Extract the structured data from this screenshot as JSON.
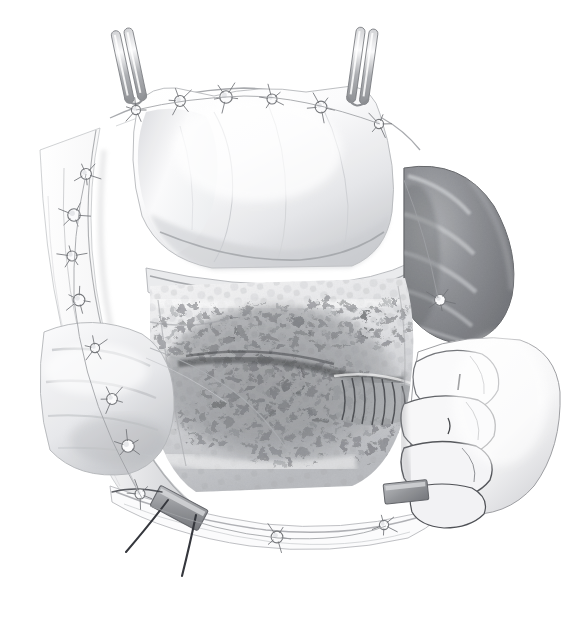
{
  "figure": {
    "domain": "medical-surgical-illustration",
    "style": "grayscale graphite / airbrush anatomical drawing on white background",
    "canvas": {
      "width": 583,
      "height": 619,
      "background": "#ffffff"
    },
    "top_crop_artifact": "· ·",
    "palette": {
      "background": "#ffffff",
      "outline": "#6f7277",
      "outline_dark": "#2f3136",
      "tissue_light": "#f3f3f4",
      "tissue_mid": "#cfd0d3",
      "tissue_shadow": "#9a9ca0",
      "spleen_dark": "#6f7176",
      "spleen_mid": "#8d9094",
      "spleen_light": "#bdbfc3",
      "tumor_dark": "#4d4f53",
      "tumor_mid": "#7e8185",
      "metal_clip": "#8a8c90",
      "suture_thread": "#2b2d33",
      "hand_outline": "#4a4c51"
    }
  },
  "structures": [
    {
      "id": "wound-edge-left",
      "label": "Left abdominal wall / wound edge",
      "region": "left margin, x 35-150, y 95-520"
    },
    {
      "id": "wound-edge-bottom",
      "label": "Inferior wound edge with sutures",
      "region": "bottom, x 110-430, y 480-560"
    },
    {
      "id": "stomach",
      "label": "Stomach (retracted cephalad)",
      "region": "upper centre, x 130-430, y 80-270"
    },
    {
      "id": "greater-omentum",
      "label": "Greater omentum / serosal fold",
      "region": "centre band, x 140-420, y 240-300"
    },
    {
      "id": "spleen",
      "label": "Spleen (lobulated, mobilised)",
      "region": "right, x 395-520, y 160-340"
    },
    {
      "id": "pancreas-bed",
      "label": "Pancreatic body / retroperitoneal bed",
      "region": "centre, x 150-400, y 290-470"
    },
    {
      "id": "nodal-mass",
      "label": "Lymph-node bearing adipose tissue",
      "region": "centre, x 160-400, y 300-470"
    },
    {
      "id": "vessel-bundle",
      "label": "Dissected vascular pedicle",
      "region": "centre-right, x 330-420, y 370-430"
    },
    {
      "id": "transverse-colon",
      "label": "Bowel loop / colon segment",
      "region": "lower left, x 45-175, y 330-470"
    },
    {
      "id": "surgeons-hand",
      "label": "Surgeon's gloved hand retracting",
      "region": "right, x 395-540, y 340-520"
    }
  ],
  "instruments": [
    {
      "id": "retractor-left",
      "name": "Double-pronged self-retaining retractor",
      "x": 133,
      "y": 75,
      "angle": -12
    },
    {
      "id": "retractor-right",
      "name": "Double-pronged self-retaining retractor",
      "x": 363,
      "y": 72,
      "angle": 8
    },
    {
      "id": "clip-center",
      "name": "Metal ligating clip / clamp jaw",
      "x": 178,
      "y": 508,
      "angle": 28
    },
    {
      "id": "clip-right",
      "name": "Metal ligating clip / clamp jaw",
      "x": 405,
      "y": 492,
      "angle": -6
    }
  ],
  "sutures": {
    "knot_count": 17,
    "knot_description": "Stay sutures with radiating cut ends along both wound margins",
    "thread_description": "Two long dark suture tails descending below the inferior wound edge",
    "knots": [
      {
        "x": 136,
        "y": 110
      },
      {
        "x": 180,
        "y": 101
      },
      {
        "x": 226,
        "y": 97
      },
      {
        "x": 272,
        "y": 99
      },
      {
        "x": 321,
        "y": 107
      },
      {
        "x": 379,
        "y": 124
      },
      {
        "x": 86,
        "y": 174
      },
      {
        "x": 74,
        "y": 215
      },
      {
        "x": 72,
        "y": 256
      },
      {
        "x": 79,
        "y": 300
      },
      {
        "x": 95,
        "y": 348
      },
      {
        "x": 112,
        "y": 399
      },
      {
        "x": 128,
        "y": 446
      },
      {
        "x": 140,
        "y": 494
      },
      {
        "x": 277,
        "y": 537
      },
      {
        "x": 384,
        "y": 525
      },
      {
        "x": 440,
        "y": 300
      }
    ],
    "threads": [
      {
        "x1": 168,
        "y1": 500,
        "x2": 126,
        "y2": 552
      },
      {
        "x1": 196,
        "y1": 515,
        "x2": 182,
        "y2": 576
      }
    ]
  },
  "annotations": {
    "labels_visible": false,
    "leader_lines_visible": false,
    "text_visible": false
  }
}
